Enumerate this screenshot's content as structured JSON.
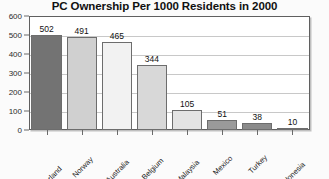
{
  "chart_data": {
    "type": "bar",
    "title": "PC Ownership Per 1000 Residents in 2000",
    "xlabel": "",
    "ylabel": "",
    "ylim": [
      0,
      600
    ],
    "yticks": [
      0,
      100,
      200,
      300,
      400,
      500,
      600
    ],
    "grid": true,
    "legend": "none",
    "categories": [
      "Switzerland",
      "Norway",
      "Australia",
      "Belgium",
      "Malaysia",
      "Mexico",
      "Turkey",
      "Indonesia"
    ],
    "values": [
      502,
      491,
      465,
      344,
      105,
      51,
      38,
      10
    ],
    "value_labels": [
      "502",
      "491",
      "465",
      "344",
      "105",
      "51",
      "38",
      "10"
    ],
    "bar_colors": [
      "#737373",
      "#d0d0d0",
      "#f2f2f2",
      "#d8d8d8",
      "#e4e4e4",
      "#9a9a9a",
      "#8a8a8a",
      "#c2c2c2"
    ],
    "bar_border_color": "#6d6d6d",
    "plot_bg": "#ffffff",
    "grid_color": "#c8c8c8",
    "frame_color": "#5f5f5f",
    "page_bg": "#fbfbfb",
    "title_color": "#111111"
  }
}
